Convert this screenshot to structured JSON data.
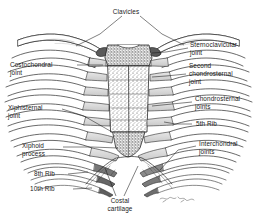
{
  "figure": {
    "type": "anatomical-illustration",
    "background_color": "#ffffff",
    "ink_color": "#1a1a1a",
    "cartilage_fill": "#d8d8d8",
    "bone_fill": "#ffffff",
    "signature": "Ted Wilcox"
  },
  "labels": {
    "clavicles": "Clavicles",
    "costochondral_joint": "Costochondral\njoint",
    "xiphisternal_joint": "Xiphisternal\njoint",
    "xiphoid_process": "Xiphoid\nprocess",
    "eighth_rib": "8th Rib",
    "tenth_rib": "10th Rib",
    "costal_cartilage": "Costal\ncartilage",
    "sternoclavicular_joint": "Sternoclavicular\njoint",
    "second_chondrosternal_joint": "Second\nchondrosternal\njoint",
    "chondrosternal_joints": "Chondrosternal\njoints",
    "fifth_rib": "5th Rib",
    "interchondral_joints": "Interchondral\njoints"
  }
}
